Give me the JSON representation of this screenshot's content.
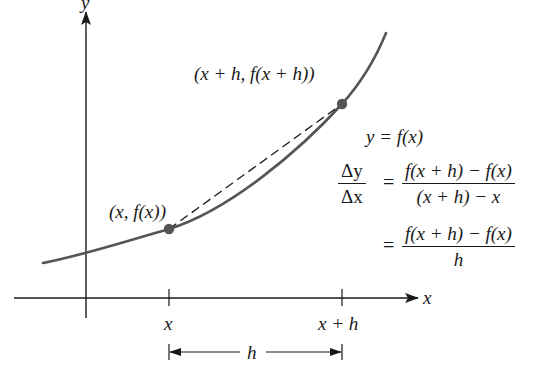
{
  "diagram": {
    "axes": {
      "x_label": "x",
      "y_label": "y"
    },
    "points": [
      {
        "label": "(x, f(x))",
        "px": [
          169,
          229
        ]
      },
      {
        "label": "(x + h, f(x + h))",
        "px": [
          342,
          104
        ]
      }
    ],
    "tick_labels": [
      "x",
      "x + h"
    ],
    "interval_label": "h",
    "equations": {
      "function": "y = f(x)",
      "slope_lhs_num": "Δy",
      "slope_lhs_den": "Δx",
      "eq_sign": "=",
      "rhs1_num": "f(x + h) − f(x)",
      "rhs1_den": "(x + h) − x",
      "rhs2_num": "f(x + h) − f(x)",
      "rhs2_den": "h"
    },
    "colors": {
      "curve": "#555555",
      "axes": "#1a1a1a",
      "points": "#555555",
      "secant": "#1a1a1a"
    }
  }
}
